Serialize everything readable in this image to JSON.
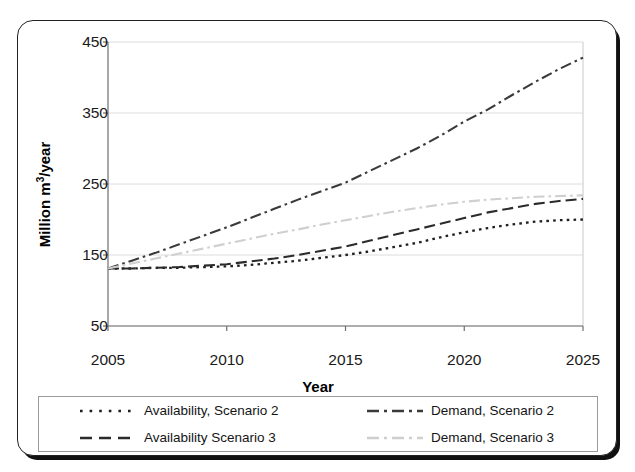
{
  "chart_data": {
    "type": "line",
    "title": "",
    "xlabel": "Year",
    "ylabel": "Million m3/year",
    "ylabel_parts": {
      "pre": "Million m",
      "sup": "3",
      "post": "/year"
    },
    "x": [
      2005,
      2006,
      2007,
      2008,
      2009,
      2010,
      2011,
      2012,
      2013,
      2014,
      2015,
      2016,
      2017,
      2018,
      2019,
      2020,
      2021,
      2022,
      2023,
      2024,
      2025
    ],
    "xlim": [
      2005,
      2025
    ],
    "ylim": [
      50,
      450
    ],
    "xticks": [
      2005,
      2010,
      2015,
      2020,
      2025
    ],
    "yticks": [
      50,
      150,
      250,
      350,
      450
    ],
    "xtick_labels": [
      "2005",
      "2010",
      "2015",
      "2020",
      "2025"
    ],
    "ytick_labels": [
      "50",
      "150",
      "250",
      "350",
      "450"
    ],
    "grid": "horizontal",
    "legend_position": "below-axes",
    "series": [
      {
        "name": "Availability, Scenario 2",
        "style": "dotted",
        "color": "#1f1f1f",
        "values": [
          131,
          131,
          132,
          132,
          133,
          134,
          136,
          139,
          142,
          146,
          150,
          155,
          161,
          167,
          175,
          182,
          188,
          193,
          197,
          199,
          200
        ]
      },
      {
        "name": "Availability Scenario 3",
        "style": "dashed",
        "color": "#2b2b2b",
        "values": [
          131,
          131,
          132,
          133,
          135,
          137,
          141,
          145,
          150,
          156,
          162,
          170,
          178,
          186,
          194,
          202,
          210,
          216,
          222,
          226,
          229
        ]
      },
      {
        "name": "Demand, Scenario 2",
        "style": "dash-dot",
        "color": "#3a3a3a",
        "values": [
          131,
          142,
          153,
          165,
          177,
          189,
          202,
          215,
          228,
          240,
          252,
          268,
          284,
          300,
          318,
          338,
          355,
          375,
          394,
          412,
          428
        ]
      },
      {
        "name": "Demand, Scenario 3",
        "style": "dash-dot",
        "color": "#cfcfcf",
        "values": [
          131,
          138,
          145,
          152,
          159,
          166,
          173,
          180,
          186,
          193,
          199,
          205,
          211,
          216,
          221,
          225,
          228,
          230,
          232,
          233,
          234
        ]
      }
    ]
  },
  "legend": {
    "items": [
      {
        "label": "Availability, Scenario 2",
        "style": "dotted",
        "color": "#1f1f1f"
      },
      {
        "label": "Demand, Scenario 2",
        "style": "dash-dot",
        "color": "#3a3a3a"
      },
      {
        "label": "Availability Scenario 3",
        "style": "dashed",
        "color": "#2b2b2b"
      },
      {
        "label": "Demand, Scenario 3",
        "style": "dash-dot",
        "color": "#cfcfcf"
      }
    ]
  },
  "axes": {
    "x_title": "Year",
    "y_title_pre": "Million m",
    "y_title_sup": "3",
    "y_title_post": "/year"
  }
}
